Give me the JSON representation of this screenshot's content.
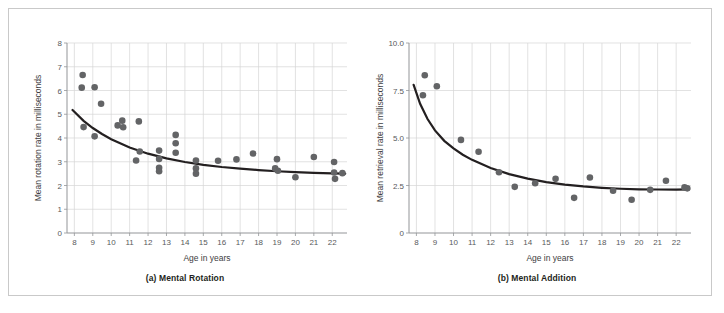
{
  "figure": {
    "background_color": "#ffffff",
    "border_color": "#c9c9c9",
    "point_color": "#636466",
    "curve_color": "#231f20",
    "grid_color": "#d6d6d6"
  },
  "panels": [
    {
      "id": "a",
      "caption": "(a) Mental Rotation",
      "xlabel": "Age in years",
      "ylabel": "Mean rotation rate in milliseconds",
      "xticks": [
        "8",
        "9",
        "10",
        "11",
        "12",
        "13",
        "14",
        "15",
        "16",
        "17",
        "18",
        "19",
        "20",
        "21",
        "22"
      ],
      "yticks": [
        "0",
        "1",
        "2",
        "3",
        "4",
        "5",
        "6",
        "7",
        "8"
      ]
    },
    {
      "id": "b",
      "caption": "(b) Mental Addition",
      "xlabel": "Age in years",
      "ylabel": "Mean retrieval rate in milliseconds",
      "xticks": [
        "8",
        "9",
        "10",
        "11",
        "12",
        "13",
        "14",
        "15",
        "16",
        "17",
        "18",
        "19",
        "20",
        "21",
        "22"
      ],
      "yticks": [
        "0",
        "2.5",
        "5.0",
        "7.5",
        "10.0"
      ]
    }
  ],
  "chart_data": [
    {
      "type": "scatter",
      "title": "(a) Mental Rotation",
      "xlabel": "Age in years",
      "ylabel": "Mean rotation rate in milliseconds",
      "xlim": [
        7.6,
        22.8
      ],
      "ylim": [
        0,
        8
      ],
      "xticks": [
        8,
        9,
        10,
        11,
        12,
        13,
        14,
        15,
        16,
        17,
        18,
        19,
        20,
        21,
        22
      ],
      "yticks": [
        0,
        1,
        2,
        3,
        4,
        5,
        6,
        7,
        8
      ],
      "grid": true,
      "legend": null,
      "points": [
        {
          "x": 8.45,
          "y": 6.65
        },
        {
          "x": 8.4,
          "y": 6.12
        },
        {
          "x": 9.1,
          "y": 6.14
        },
        {
          "x": 9.45,
          "y": 5.44
        },
        {
          "x": 8.5,
          "y": 4.46
        },
        {
          "x": 9.1,
          "y": 4.07
        },
        {
          "x": 10.6,
          "y": 4.73
        },
        {
          "x": 10.35,
          "y": 4.53
        },
        {
          "x": 10.65,
          "y": 4.45
        },
        {
          "x": 11.5,
          "y": 4.7
        },
        {
          "x": 11.35,
          "y": 3.05
        },
        {
          "x": 11.55,
          "y": 3.43
        },
        {
          "x": 12.6,
          "y": 3.47
        },
        {
          "x": 12.6,
          "y": 3.12
        },
        {
          "x": 12.6,
          "y": 2.75
        },
        {
          "x": 12.6,
          "y": 2.6
        },
        {
          "x": 13.5,
          "y": 4.13
        },
        {
          "x": 13.5,
          "y": 3.78
        },
        {
          "x": 13.5,
          "y": 3.38
        },
        {
          "x": 14.6,
          "y": 3.05
        },
        {
          "x": 14.6,
          "y": 2.72
        },
        {
          "x": 14.6,
          "y": 2.5
        },
        {
          "x": 15.8,
          "y": 3.04
        },
        {
          "x": 16.8,
          "y": 3.1
        },
        {
          "x": 17.7,
          "y": 3.35
        },
        {
          "x": 19.0,
          "y": 3.11
        },
        {
          "x": 18.9,
          "y": 2.72
        },
        {
          "x": 19.05,
          "y": 2.62
        },
        {
          "x": 20.0,
          "y": 2.35
        },
        {
          "x": 21.0,
          "y": 3.2
        },
        {
          "x": 22.1,
          "y": 2.99
        },
        {
          "x": 22.1,
          "y": 2.55
        },
        {
          "x": 22.55,
          "y": 2.52
        },
        {
          "x": 22.15,
          "y": 2.28
        }
      ],
      "fit_curve": {
        "form": "power",
        "description": "decreasing power fit from about 5.2 at age 8 to about 2.5 at age 22.7",
        "points": [
          {
            "x": 7.9,
            "y": 5.18
          },
          {
            "x": 8.5,
            "y": 4.72
          },
          {
            "x": 9.0,
            "y": 4.42
          },
          {
            "x": 9.5,
            "y": 4.17
          },
          {
            "x": 10.0,
            "y": 3.95
          },
          {
            "x": 11.0,
            "y": 3.6
          },
          {
            "x": 12.0,
            "y": 3.34
          },
          {
            "x": 13.0,
            "y": 3.14
          },
          {
            "x": 14.0,
            "y": 2.99
          },
          {
            "x": 15.0,
            "y": 2.87
          },
          {
            "x": 16.0,
            "y": 2.78
          },
          {
            "x": 17.0,
            "y": 2.71
          },
          {
            "x": 18.0,
            "y": 2.65
          },
          {
            "x": 19.0,
            "y": 2.6
          },
          {
            "x": 20.0,
            "y": 2.56
          },
          {
            "x": 21.0,
            "y": 2.53
          },
          {
            "x": 22.0,
            "y": 2.51
          },
          {
            "x": 22.7,
            "y": 2.5
          }
        ]
      }
    },
    {
      "type": "scatter",
      "title": "(b) Mental Addition",
      "xlabel": "Age in years",
      "ylabel": "Mean retrieval rate in milliseconds",
      "xlim": [
        7.6,
        22.8
      ],
      "ylim": [
        0,
        10
      ],
      "xticks": [
        8,
        9,
        10,
        11,
        12,
        13,
        14,
        15,
        16,
        17,
        18,
        19,
        20,
        21,
        22
      ],
      "yticks": [
        0,
        2.5,
        5.0,
        7.5,
        10.0
      ],
      "grid": true,
      "legend": null,
      "points": [
        {
          "x": 8.45,
          "y": 8.3
        },
        {
          "x": 8.35,
          "y": 7.25
        },
        {
          "x": 9.1,
          "y": 7.72
        },
        {
          "x": 10.4,
          "y": 4.9
        },
        {
          "x": 11.35,
          "y": 4.28
        },
        {
          "x": 12.45,
          "y": 3.2
        },
        {
          "x": 13.3,
          "y": 2.43
        },
        {
          "x": 14.4,
          "y": 2.62
        },
        {
          "x": 15.5,
          "y": 2.85
        },
        {
          "x": 16.5,
          "y": 1.85
        },
        {
          "x": 17.35,
          "y": 2.92
        },
        {
          "x": 18.6,
          "y": 2.22
        },
        {
          "x": 19.6,
          "y": 1.75
        },
        {
          "x": 20.6,
          "y": 2.27
        },
        {
          "x": 21.45,
          "y": 2.75
        },
        {
          "x": 22.45,
          "y": 2.4
        },
        {
          "x": 22.6,
          "y": 2.35
        }
      ],
      "fit_curve": {
        "form": "power",
        "description": "steeply decreasing power fit from about 7.8 at age 8 leveling to about 2.3 by age 19",
        "points": [
          {
            "x": 7.85,
            "y": 7.8
          },
          {
            "x": 8.2,
            "y": 6.8
          },
          {
            "x": 8.6,
            "y": 6.0
          },
          {
            "x": 9.0,
            "y": 5.4
          },
          {
            "x": 9.5,
            "y": 4.85
          },
          {
            "x": 10.0,
            "y": 4.45
          },
          {
            "x": 10.5,
            "y": 4.12
          },
          {
            "x": 11.0,
            "y": 3.85
          },
          {
            "x": 12.0,
            "y": 3.42
          },
          {
            "x": 13.0,
            "y": 3.1
          },
          {
            "x": 14.0,
            "y": 2.86
          },
          {
            "x": 15.0,
            "y": 2.68
          },
          {
            "x": 16.0,
            "y": 2.55
          },
          {
            "x": 17.0,
            "y": 2.45
          },
          {
            "x": 18.0,
            "y": 2.38
          },
          {
            "x": 19.0,
            "y": 2.33
          },
          {
            "x": 20.0,
            "y": 2.3
          },
          {
            "x": 21.0,
            "y": 2.29
          },
          {
            "x": 22.0,
            "y": 2.28
          },
          {
            "x": 22.7,
            "y": 2.3
          }
        ]
      }
    }
  ]
}
